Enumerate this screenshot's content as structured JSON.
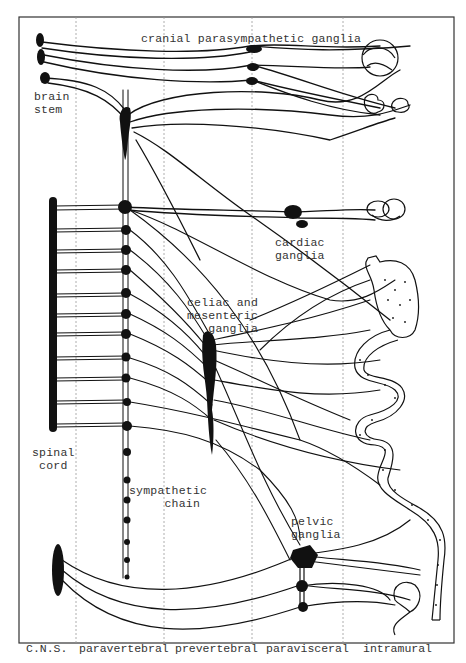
{
  "figure": {
    "labels": {
      "cranial": "cranial parasympathetic ganglia",
      "brain_stem": "brain\nstem",
      "cardiac": "cardiac\nganglia",
      "celiac": "celiac and\nmesenteric\n   ganglia",
      "spinal_cord": "spinal\n cord",
      "sympathetic_chain": "sympathetic\n     chain",
      "pelvic": "pelvic\nganglia"
    },
    "columns": [
      "C.N.S.",
      "paravertebral",
      "prevertebral",
      "paravisceral",
      "intramural"
    ],
    "colors": {
      "ink": "#111111",
      "frame": "#333333",
      "divider": "#9a9a9a",
      "background": "#ffffff"
    }
  }
}
